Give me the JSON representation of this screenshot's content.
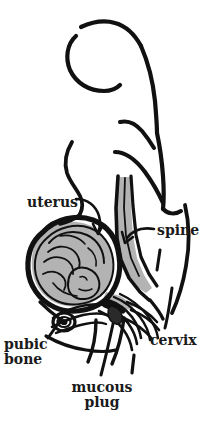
{
  "diagram": {
    "background_color": "#ffffff",
    "ink_color": "#111111",
    "tissue_fill_color": "#b3b3b3",
    "labels": {
      "uterus": "uterus",
      "spine": "spine",
      "cervix": "cervix",
      "pubic_bone_line1": "pubic",
      "pubic_bone_line2": "bone",
      "mucous_plug_line1": "mucous",
      "mucous_plug_line2": "plug"
    },
    "parts": [
      {
        "name": "torso-outline",
        "description": "profile outline of pregnant woman, breast, back, buttock and thigh"
      },
      {
        "name": "uterus",
        "description": "large oval uterus wall, thick black outline, gray interior"
      },
      {
        "name": "fetus",
        "description": "gray fetus curled head-down inside the uterus"
      },
      {
        "name": "spine",
        "description": "gray vertical band along the back, lumbar curve"
      },
      {
        "name": "cervix",
        "description": "concentric layered lines at the lower uterus opening"
      },
      {
        "name": "mucous-plug",
        "description": "small plug at the cervical canal"
      },
      {
        "name": "pubic-bone",
        "description": "small oval spiral bone at front lower pelvis"
      }
    ]
  }
}
